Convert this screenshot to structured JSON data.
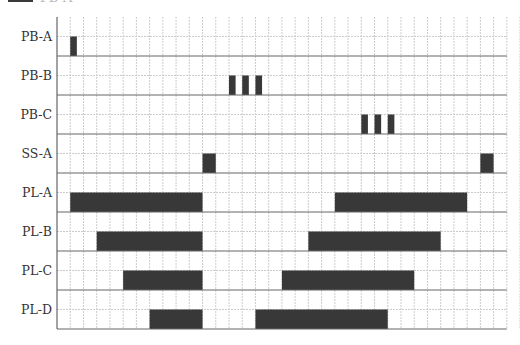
{
  "legend": {
    "swatch_color": "#3a3a3a",
    "label": "PB-A"
  },
  "chart_data": {
    "type": "timeline",
    "title": "",
    "xlabel": "",
    "ylabel": "",
    "grid": true,
    "x_columns": 34,
    "col_width_units": 1,
    "rows": [
      {
        "label": "PB-A",
        "blocks": [
          {
            "start": 1,
            "end": 1.5
          }
        ]
      },
      {
        "label": "PB-B",
        "blocks": [
          {
            "start": 13,
            "end": 13.5
          },
          {
            "start": 14,
            "end": 14.5
          },
          {
            "start": 15,
            "end": 15.5
          }
        ]
      },
      {
        "label": "PB-C",
        "blocks": [
          {
            "start": 23,
            "end": 23.5
          },
          {
            "start": 24,
            "end": 24.5
          },
          {
            "start": 25,
            "end": 25.5
          }
        ]
      },
      {
        "label": "SS-A",
        "blocks": [
          {
            "start": 11,
            "end": 12
          },
          {
            "start": 32,
            "end": 33
          }
        ]
      },
      {
        "label": "PL-A",
        "blocks": [
          {
            "start": 1,
            "end": 11
          },
          {
            "start": 21,
            "end": 31
          }
        ]
      },
      {
        "label": "PL-B",
        "blocks": [
          {
            "start": 3,
            "end": 11
          },
          {
            "start": 19,
            "end": 29
          }
        ]
      },
      {
        "label": "PL-C",
        "blocks": [
          {
            "start": 5,
            "end": 11
          },
          {
            "start": 17,
            "end": 27
          }
        ]
      },
      {
        "label": "PL-D",
        "blocks": [
          {
            "start": 7,
            "end": 11
          },
          {
            "start": 15,
            "end": 25
          }
        ]
      }
    ],
    "colors": {
      "block": "#383838",
      "grid": "#cccccc",
      "row_line": "#666666",
      "axis": "#666666"
    }
  }
}
